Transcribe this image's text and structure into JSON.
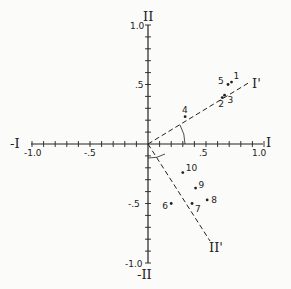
{
  "chart_data": {
    "type": "scatter",
    "title": "",
    "xlabel": "I",
    "ylabel": "II",
    "x_neg_label": "-I",
    "y_neg_label": "-II",
    "xlim": [
      -1.0,
      1.0
    ],
    "ylim": [
      -1.0,
      1.0
    ],
    "x_ticks": [
      "-1.0",
      "-.5",
      ".5",
      "1.0"
    ],
    "y_ticks": [
      "1.0",
      ".5",
      "-.5",
      "-1.0"
    ],
    "grid": false,
    "rotated_axes": [
      {
        "label": "I'",
        "style": "dashed",
        "direction": [
          0.85,
          0.52
        ]
      },
      {
        "label": "II'",
        "style": "dashed",
        "direction": [
          0.52,
          -0.85
        ]
      }
    ],
    "points": [
      {
        "label": "1",
        "x": 0.72,
        "y": 0.52
      },
      {
        "label": "2",
        "x": 0.64,
        "y": 0.39
      },
      {
        "label": "3",
        "x": 0.66,
        "y": 0.41
      },
      {
        "label": "4",
        "x": 0.32,
        "y": 0.23
      },
      {
        "label": "5",
        "x": 0.69,
        "y": 0.5
      },
      {
        "label": "6",
        "x": 0.2,
        "y": -0.5
      },
      {
        "label": "7",
        "x": 0.38,
        "y": -0.5
      },
      {
        "label": "8",
        "x": 0.51,
        "y": -0.47
      },
      {
        "label": "9",
        "x": 0.41,
        "y": -0.37
      },
      {
        "label": "10",
        "x": 0.3,
        "y": -0.24
      }
    ]
  }
}
